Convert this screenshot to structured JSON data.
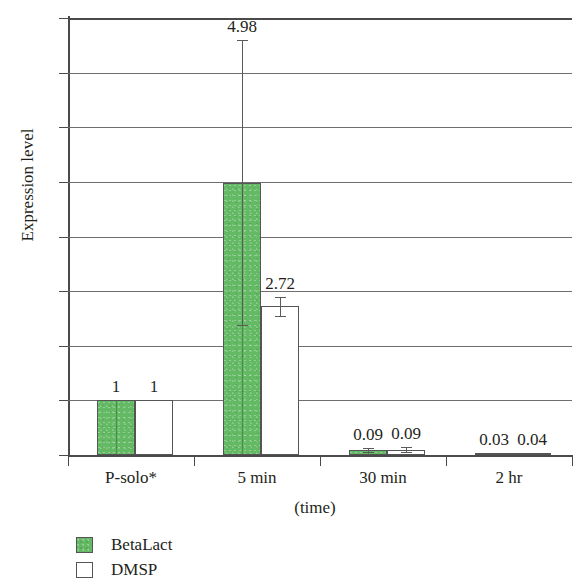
{
  "chart_data": {
    "type": "bar",
    "title": "",
    "xlabel": "(time)",
    "ylabel": "Expression level",
    "categories": [
      "P-solo*",
      "5 min",
      "30 min",
      "2 hr"
    ],
    "ylim": [
      0,
      8
    ],
    "yticks": [
      0,
      1,
      2,
      3,
      4,
      5,
      6,
      7,
      8
    ],
    "ytick_labels": [
      "0",
      "1",
      "2",
      "3",
      "4",
      "5",
      "6",
      "7",
      "8"
    ],
    "grid": true,
    "legend_position": "bottom-left",
    "series": [
      {
        "name": "BetaLact",
        "color": "#64b964",
        "values": [
          1,
          4.98,
          0.09,
          0.03
        ],
        "data_labels": [
          "1",
          "4.98",
          "0.09",
          "0.03"
        ],
        "error_low": [
          1,
          2.38,
          0.05,
          0.03
        ],
        "error_high": [
          1,
          7.6,
          0.13,
          0.03
        ]
      },
      {
        "name": "DMSP",
        "color": "#ffffff",
        "values": [
          1,
          2.72,
          0.09,
          0.04
        ],
        "data_labels": [
          "1",
          "2.72",
          "0.09",
          "0.04"
        ],
        "error_low": [
          1,
          2.55,
          0.05,
          0.04
        ],
        "error_high": [
          1,
          2.9,
          0.14,
          0.04
        ]
      }
    ]
  },
  "legend": {
    "items": [
      {
        "label": "BetaLact",
        "swatch": "green"
      },
      {
        "label": "DMSP",
        "swatch": "white"
      }
    ]
  }
}
